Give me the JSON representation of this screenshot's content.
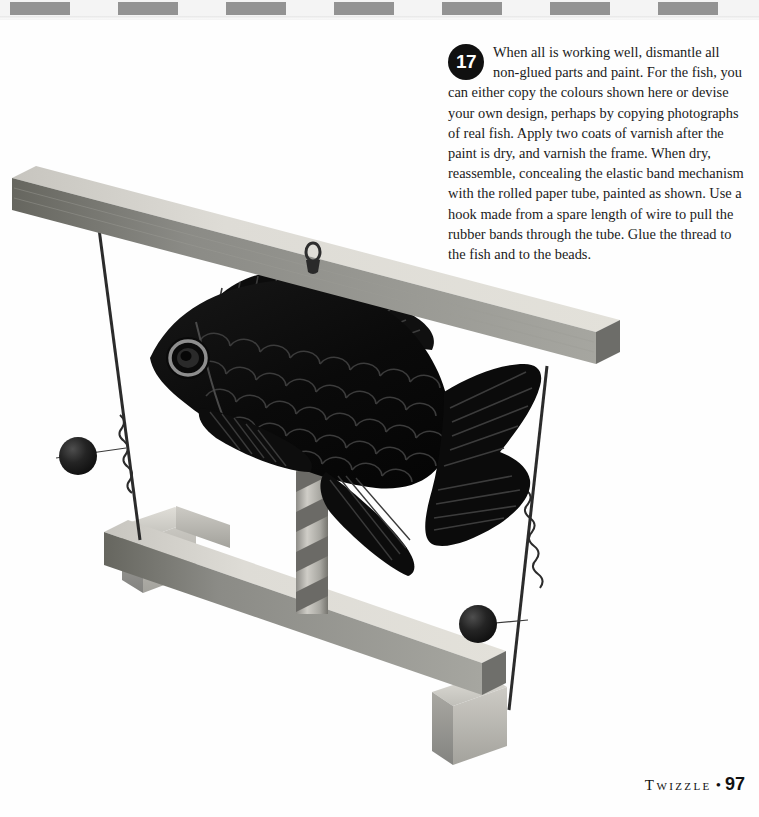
{
  "page": {
    "background_color": "#ffffff",
    "border": {
      "name": "checkered-rule",
      "dash_color": "#939393",
      "dash_count": 7,
      "dash_width": 60,
      "dash_period": 108,
      "dash_start_x": 10
    }
  },
  "instruction": {
    "step_number": "17",
    "body": "When all is working well, dismantle all non-glued parts and paint. For the fish, you can either copy the colours shown here or devise your own design, perhaps by copying photographs of real fish. Apply two coats of varnish after the paint is dry, and varnish the frame. When dry, reassemble, concealing the elastic band mechanism with the rolled paper tube, painted as shown. Use a hook made from a spare length of wire to pull the rubber bands through the tube. Glue the thread to the fish and to the beads."
  },
  "footer": {
    "title": "Twizzle",
    "bullet": "•",
    "page_number": "97"
  },
  "photo": {
    "caption_subject": "twizzle-fish-toy",
    "colors": {
      "wood_top": "#d9d7d1",
      "wood_front": "#8d8d8a",
      "wood_side": "#6e6e6c",
      "wood_light": "#c9c7c1",
      "fish_body": "#0b0b0b",
      "fish_scale_shade": "#2b2b2b",
      "fish_highlight": "#4a4a4a",
      "bead": "#1c1c1c",
      "wire": "#2a2a2a",
      "tube_light": "#c2c0ba",
      "tube_dark": "#6a6a68"
    },
    "parts": [
      {
        "name": "top-beam",
        "label": "top cross beam"
      },
      {
        "name": "screw-eye-hook",
        "label": "screw eye hook"
      },
      {
        "name": "fish",
        "label": "painted fish"
      },
      {
        "name": "paper-tube",
        "label": "rolled paper tube"
      },
      {
        "name": "bottom-beam",
        "label": "bottom beam"
      },
      {
        "name": "left-foot",
        "label": "left cross foot"
      },
      {
        "name": "right-foot",
        "label": "right cross foot"
      },
      {
        "name": "left-wire",
        "label": "left wire"
      },
      {
        "name": "right-wire",
        "label": "right wire"
      },
      {
        "name": "left-bead",
        "label": "left bead"
      },
      {
        "name": "right-bead",
        "label": "right bead"
      },
      {
        "name": "thread",
        "label": "thread"
      }
    ]
  }
}
